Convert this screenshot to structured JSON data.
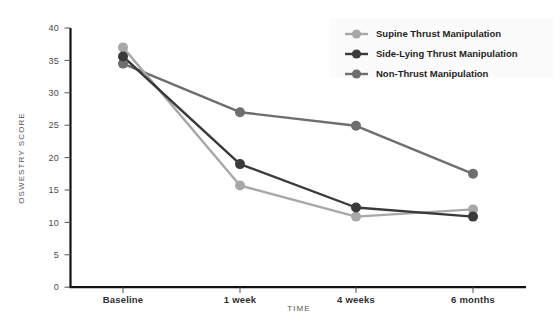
{
  "chart_data": {
    "type": "line",
    "title": "",
    "xlabel": "TIME",
    "ylabel": "OSWESTRY SCORE",
    "categories": [
      "Baseline",
      "1 week",
      "4 weeks",
      "6 months"
    ],
    "ylim": [
      0,
      40
    ],
    "yticks": [
      0,
      5,
      10,
      15,
      20,
      25,
      30,
      35,
      40
    ],
    "ytick_labels": [
      "0",
      "5",
      "10",
      "15",
      "20",
      "25",
      "30",
      "35",
      "40"
    ],
    "grid": false,
    "legend_position": "top-right",
    "series": [
      {
        "name": "Supine Thrust Manipulation",
        "color": "#a8a8a8",
        "values": [
          37.0,
          15.7,
          10.9,
          12.0
        ]
      },
      {
        "name": "Side-Lying Thrust Manipulation",
        "color": "#3a3a3a",
        "values": [
          35.6,
          19.0,
          12.3,
          10.9
        ]
      },
      {
        "name": "Non-Thrust Manipulation",
        "color": "#6e6e6e",
        "values": [
          34.5,
          27.0,
          24.9,
          17.5
        ]
      }
    ]
  },
  "axis": {
    "x_title": "TIME",
    "y_title": "OSWESTRY SCORE"
  },
  "legend": {
    "items": [
      {
        "label": "Supine Thrust Manipulation",
        "color": "#a8a8a8"
      },
      {
        "label": "Side-Lying Thrust Manipulation",
        "color": "#3a3a3a"
      },
      {
        "label": "Non-Thrust Manipulation",
        "color": "#6e6e6e"
      }
    ]
  },
  "ticks": {
    "y": [
      "40",
      "35",
      "30",
      "25",
      "20",
      "15",
      "10",
      "5",
      "0"
    ],
    "x": [
      "Baseline",
      "1 week",
      "4 weeks",
      "6 months"
    ]
  }
}
